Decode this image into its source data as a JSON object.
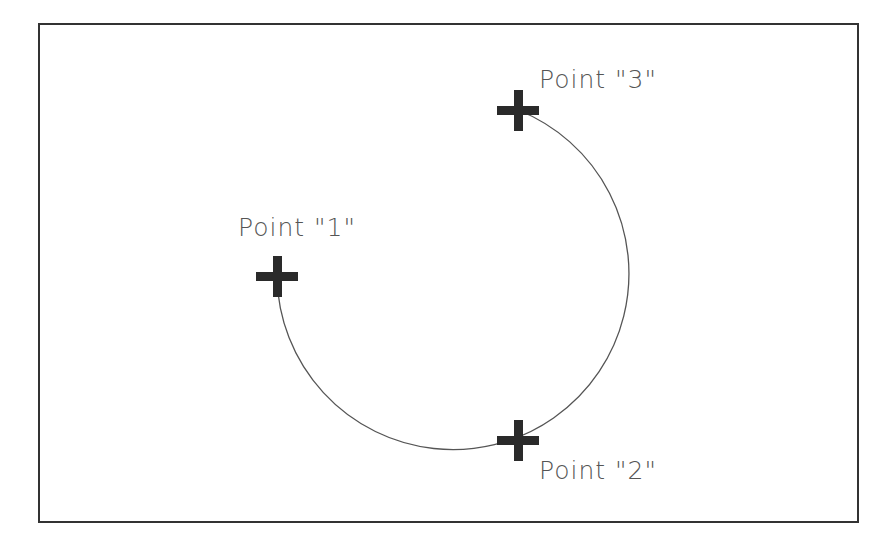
{
  "diagram": {
    "colors": {
      "background": "#ffffff",
      "frame": "#333333",
      "arc": "#555555",
      "marker": "#2a2a2a",
      "label": "#555555"
    },
    "frame": {
      "x": 39,
      "y": 24,
      "width": 819,
      "height": 498
    },
    "arc": {
      "center_x": 452,
      "center_y": 276,
      "radius": 176
    },
    "points": [
      {
        "id": "1",
        "label": "Point \"1\"",
        "x": 277,
        "y": 276,
        "label_x": 238,
        "label_y": 236
      },
      {
        "id": "2",
        "label": "Point \"2\"",
        "x": 518,
        "y": 440,
        "label_x": 539,
        "label_y": 479
      },
      {
        "id": "3",
        "label": "Point \"3\"",
        "x": 518,
        "y": 110,
        "label_x": 539,
        "label_y": 88
      }
    ]
  }
}
